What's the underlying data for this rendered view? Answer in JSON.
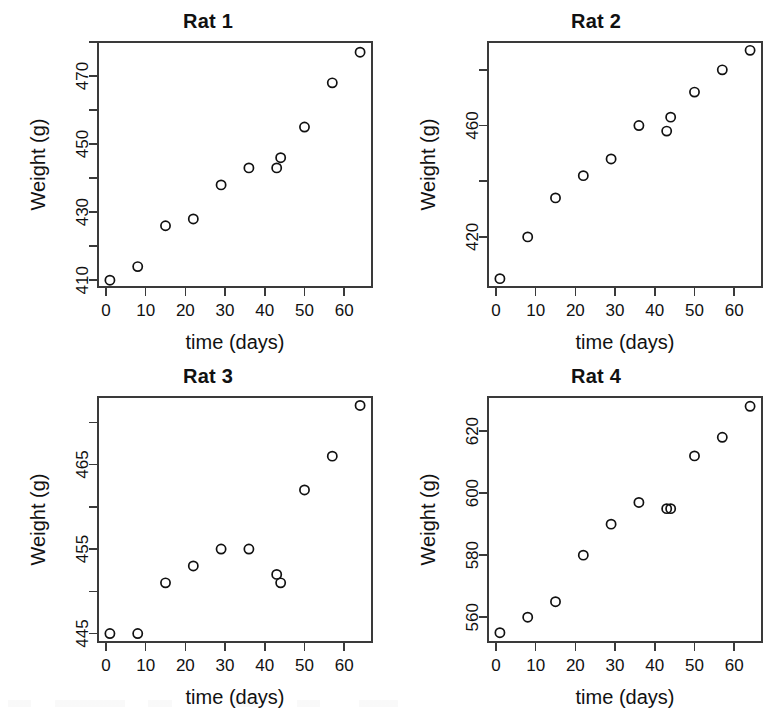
{
  "figure": {
    "layout": "2x2 panel grid",
    "background_color": "#ffffff",
    "foreground_color": "#111111",
    "marker_symbol": "open-circle"
  },
  "axis_titles": {
    "x": "time (days)",
    "y": "Weight (g)"
  },
  "x_ticks": [
    "0",
    "10",
    "20",
    "30",
    "40",
    "50",
    "60"
  ],
  "panels": [
    {
      "id": "rat-1",
      "title": "Rat 1",
      "y_ticks_labeled": [
        "410",
        "430",
        "450",
        "470"
      ]
    },
    {
      "id": "rat-2",
      "title": "Rat 2",
      "y_ticks_labeled": [
        "420",
        "460"
      ]
    },
    {
      "id": "rat-3",
      "title": "Rat 3",
      "y_ticks_labeled": [
        "445",
        "455",
        "465"
      ]
    },
    {
      "id": "rat-4",
      "title": "Rat 4",
      "y_ticks_labeled": [
        "560",
        "580",
        "600",
        "620"
      ]
    }
  ],
  "chart_data": [
    {
      "type": "scatter",
      "title": "Rat 1",
      "xlabel": "time (days)",
      "ylabel": "Weight (g)",
      "x": [
        1,
        8,
        15,
        22,
        29,
        36,
        43,
        44,
        50,
        57,
        64
      ],
      "y": [
        410,
        414,
        426,
        428,
        438,
        443,
        443,
        446,
        455,
        468,
        477
      ],
      "xlim": [
        -2,
        67
      ],
      "ylim": [
        408,
        480
      ],
      "x_ticks": [
        0,
        10,
        20,
        30,
        40,
        50,
        60
      ],
      "y_ticks_major": [
        410,
        430,
        450,
        470
      ],
      "y_ticks_minor": [
        420,
        440,
        460,
        480
      ],
      "grid": false,
      "legend": "none",
      "marker": "open-circle"
    },
    {
      "type": "scatter",
      "title": "Rat 2",
      "xlabel": "time (days)",
      "ylabel": "Weight (g)",
      "x": [
        1,
        8,
        15,
        22,
        29,
        36,
        43,
        44,
        50,
        57,
        64
      ],
      "y": [
        405,
        420,
        434,
        442,
        448,
        460,
        458,
        463,
        472,
        480,
        487
      ],
      "xlim": [
        -2,
        67
      ],
      "ylim": [
        402,
        490
      ],
      "x_ticks": [
        0,
        10,
        20,
        30,
        40,
        50,
        60
      ],
      "y_ticks_major": [
        420,
        460
      ],
      "y_ticks_minor": [
        440,
        480
      ],
      "grid": false,
      "legend": "none",
      "marker": "open-circle"
    },
    {
      "type": "scatter",
      "title": "Rat 3",
      "xlabel": "time (days)",
      "ylabel": "Weight (g)",
      "x": [
        1,
        8,
        15,
        22,
        29,
        36,
        43,
        44,
        50,
        57,
        64
      ],
      "y": [
        445,
        445,
        451,
        453,
        455,
        455,
        452,
        451,
        462,
        466,
        472
      ],
      "xlim": [
        -2,
        67
      ],
      "ylim": [
        444,
        473
      ],
      "x_ticks": [
        0,
        10,
        20,
        30,
        40,
        50,
        60
      ],
      "y_ticks_major": [
        445,
        455,
        465
      ],
      "y_ticks_minor": [
        450,
        460,
        470
      ],
      "grid": false,
      "legend": "none",
      "marker": "open-circle"
    },
    {
      "type": "scatter",
      "title": "Rat 4",
      "xlabel": "time (days)",
      "ylabel": "Weight (g)",
      "x": [
        1,
        8,
        15,
        22,
        29,
        36,
        43,
        44,
        50,
        57,
        64
      ],
      "y": [
        555,
        560,
        565,
        580,
        590,
        597,
        595,
        595,
        612,
        618,
        628
      ],
      "xlim": [
        -2,
        67
      ],
      "ylim": [
        552,
        631
      ],
      "x_ticks": [
        0,
        10,
        20,
        30,
        40,
        50,
        60
      ],
      "y_ticks_major": [
        560,
        580,
        600,
        620
      ],
      "y_ticks_minor": [],
      "grid": false,
      "legend": "none",
      "marker": "open-circle"
    }
  ]
}
